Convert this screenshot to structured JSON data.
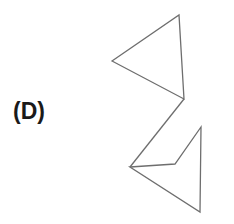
{
  "label": "(D)",
  "colors": {
    "stroke": "#6e6e6e",
    "text": "#1a1a1a",
    "background": "#ffffff"
  },
  "figure": {
    "top_triangle": "112,61 179,15 184,99",
    "connector": "184,99 130,167",
    "bottom_shape": "130,167 175,164 201,127 200,212"
  }
}
